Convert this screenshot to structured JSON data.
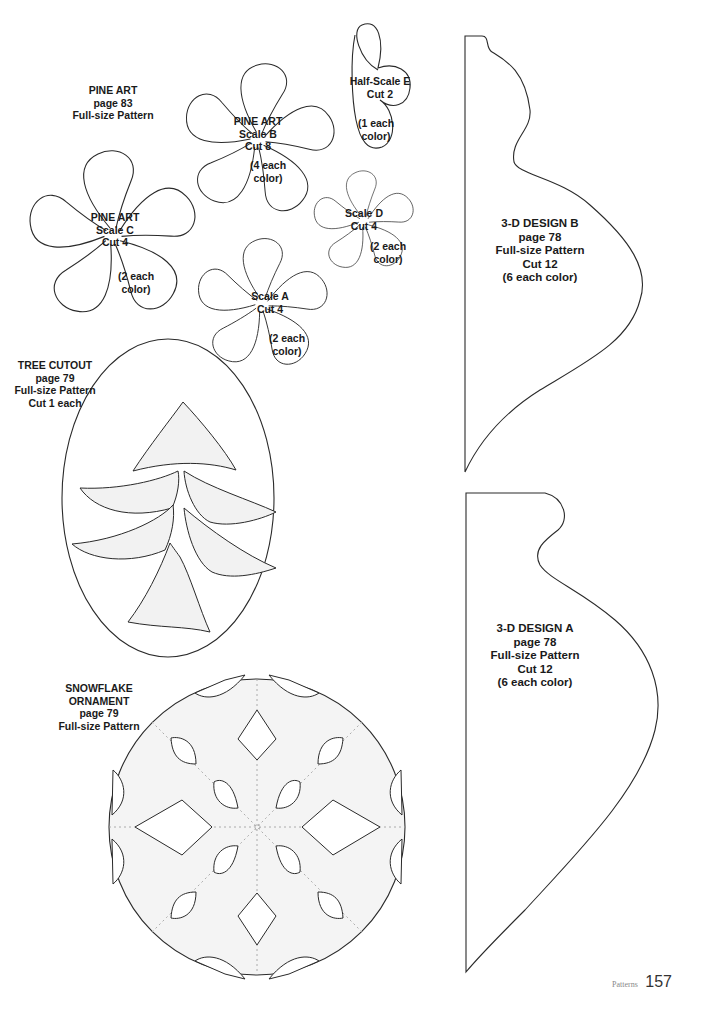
{
  "page": {
    "section": "Patterns",
    "page_number": "157"
  },
  "patterns": {
    "pine_art_header": {
      "title": "PINE ART",
      "page": "page 83",
      "note": "Full-size Pattern"
    },
    "pine_art_b": {
      "title": "PINE ART",
      "scale": "Scale B",
      "cut": "Cut 8",
      "each1": "(4 each",
      "each2": "color)"
    },
    "pine_art_c": {
      "title": "PINE ART",
      "scale": "Scale C",
      "cut": "Cut 4",
      "each1": "(2 each",
      "each2": "color)"
    },
    "scale_a": {
      "scale": "Scale A",
      "cut": "Cut 4",
      "each1": "(2 each",
      "each2": "color)"
    },
    "scale_d": {
      "scale": "Scale D",
      "cut": "Cut 4",
      "each1": "(2 each",
      "each2": "color)"
    },
    "half_scale_e": {
      "scale": "Half-Scale E",
      "cut": "Cut 2",
      "each1": "(1 each",
      "each2": "color)"
    },
    "design_b": {
      "title": "3-D DESIGN B",
      "page": "page 78",
      "note": "Full-size Pattern",
      "cut": "Cut 12",
      "each": "(6 each color)"
    },
    "design_a": {
      "title": "3-D DESIGN A",
      "page": "page 78",
      "note": "Full-size Pattern",
      "cut": "Cut 12",
      "each": "(6 each color)"
    },
    "tree_cutout": {
      "title": "TREE CUTOUT",
      "page": "page 79",
      "note": "Full-size Pattern",
      "cut": "Cut 1 each"
    },
    "snowflake": {
      "title1": "SNOWFLAKE",
      "title2": "ORNAMENT",
      "page": "page 79",
      "note": "Full-size Pattern"
    }
  },
  "colors": {
    "line": "#2a2a2a",
    "fill_light": "#f2f2f2",
    "dotted": "#9a9a9a"
  }
}
